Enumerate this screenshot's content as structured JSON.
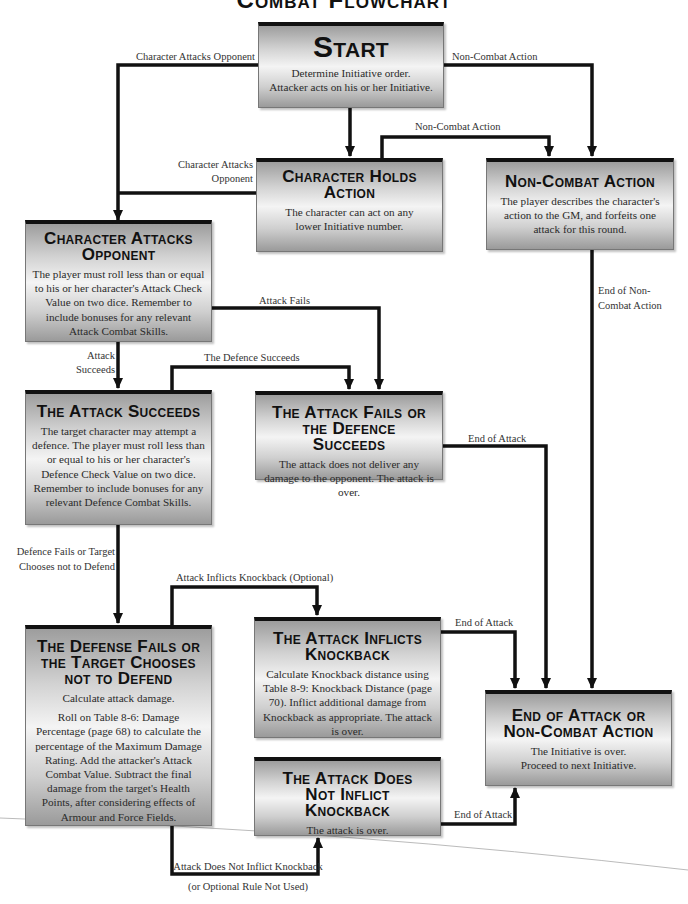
{
  "page": {
    "title": "Combat Flowchart"
  },
  "nodes": {
    "start": {
      "title": "Start",
      "body": [
        "Determine Initiative order.",
        "Attacker acts on his or her Initiative."
      ]
    },
    "holds_action": {
      "title": "Character Holds Action",
      "body": [
        "The character can act on any lower Initiative number."
      ]
    },
    "non_combat": {
      "title": "Non-Combat Action",
      "body": [
        "The player describes the character's action to the GM, and forfeits one attack for this round."
      ]
    },
    "attacks_opponent": {
      "title": "Character Attacks Opponent",
      "body": [
        "The player must roll less than or equal to his or her character's Attack Check Value on two dice.  Remember to include bonuses for any relevant Attack Combat Skills."
      ]
    },
    "attack_succeeds": {
      "title": "The Attack Succeeds",
      "body": [
        "The target character may attempt a defence.  The player must roll less than or equal to his or her character's Defence Check Value on two dice.  Remember to include bonuses for any relevant Defence Combat Skills."
      ]
    },
    "attack_fails": {
      "title": "The Attack Fails or the Defence Succeeds",
      "body": [
        "The attack does not deliver any damage to the opponent.  The attack is over."
      ]
    },
    "defense_fails": {
      "title": "The Defense Fails or the Target Chooses not to Defend",
      "body": [
        "Calculate attack damage.",
        "Roll on Table 8-6: Damage Percentage (page 68) to calculate the percentage of the Maximum Damage Rating.  Add the attacker's Attack Combat Value.  Subtract the final damage from the target's Health Points, after considering effects of Armour and Force Fields."
      ]
    },
    "knockback": {
      "title": "The Attack Inflicts Knockback",
      "body": [
        "Calculate Knockback distance using Table 8-9: Knockback Distance (page 70).  Inflict additional damage from Knockback as appropriate.  The attack is over."
      ]
    },
    "no_knockback": {
      "title": "The Attack Does Not Inflict Knockback",
      "body": [
        "The attack is over."
      ]
    },
    "end": {
      "title": "End of Attack or Non-Combat Action",
      "body": [
        "The Initiative is over.",
        "Proceed to next Initiative."
      ]
    }
  },
  "edges": {
    "start_to_attacks": "Character Attacks Opponent",
    "start_to_noncombat": "Non-Combat Action",
    "holds_to_noncombat": "Non-Combat Action",
    "holds_to_attacks": "Character Attacks Opponent",
    "noncombat_to_end": "End of Non-Combat Action",
    "attacks_fail": "Attack Fails",
    "attacks_succeed": "Attack Succeeds",
    "defence_succeeds": "The Defence Succeeds",
    "fails_to_end": "End of Attack",
    "defence_fails": "Defence Fails or Target Chooses not to Defend",
    "inflicts_knockback": "Attack Inflicts Knockback (Optional)",
    "knockback_to_end": "End of Attack",
    "no_knockback_to_end": "End of Attack",
    "no_knockback_line1": "Attack Does Not Inflict Knockback",
    "no_knockback_line2": "(or Optional Rule Not Used)"
  },
  "colors": {
    "line": "#111111",
    "box_border_top": "#111111",
    "label_text": "#333333"
  }
}
